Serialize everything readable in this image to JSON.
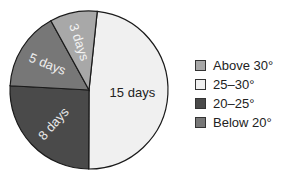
{
  "chart_data": {
    "type": "pie",
    "title": "",
    "unit": "days",
    "slices": [
      {
        "label": "25–30°",
        "value": 15,
        "text": "15 days",
        "color": "#f0f0f0",
        "text_color": "#222222"
      },
      {
        "label": "20–25°",
        "value": 8,
        "text": "8 days",
        "color": "#4a4a4a",
        "text_color": "#e8e8e8"
      },
      {
        "label": "Below 20°",
        "value": 5,
        "text": "5 days",
        "color": "#777777",
        "text_color": "#eeeeee"
      },
      {
        "label": "Above 30°",
        "value": 3,
        "text": "3 days",
        "color": "#a8a8a8",
        "text_color": "#f4f4f4"
      }
    ],
    "start_angle_deg": 6,
    "direction": "clockwise",
    "legend": {
      "position": "right",
      "entries": [
        {
          "label": "Above 30°",
          "color": "#a8a8a8"
        },
        {
          "label": "25–30°",
          "color": "#f0f0f0"
        },
        {
          "label": "20–25°",
          "color": "#4a4a4a"
        },
        {
          "label": "Below 20°",
          "color": "#777777"
        }
      ]
    }
  }
}
